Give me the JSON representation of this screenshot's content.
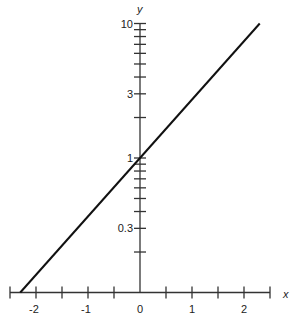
{
  "chart_data": {
    "type": "line",
    "title": "",
    "xlabel": "x",
    "ylabel": "y",
    "yscale": "log",
    "xlim": [
      -2.5,
      2.5
    ],
    "ylim": [
      0.1,
      10
    ],
    "x_ticks": [
      -2.5,
      -2,
      -1.5,
      -1,
      -0.5,
      0,
      0.5,
      1,
      1.5,
      2,
      2.5
    ],
    "x_tick_labels": [
      {
        "value": -2,
        "label": "-2"
      },
      {
        "value": -1,
        "label": "-1"
      },
      {
        "value": 0,
        "label": "0"
      },
      {
        "value": 1,
        "label": "1"
      },
      {
        "value": 2,
        "label": "2"
      }
    ],
    "y_ticks": [
      0.2,
      0.3,
      0.4,
      0.5,
      0.6,
      0.7,
      0.8,
      0.9,
      1,
      2,
      3,
      4,
      5,
      6,
      7,
      8,
      9,
      10
    ],
    "y_tick_labels": [
      {
        "value": 0.3,
        "label": "0.3"
      },
      {
        "value": 1,
        "label": "1"
      },
      {
        "value": 3,
        "label": "3"
      },
      {
        "value": 10,
        "label": "10"
      }
    ],
    "grid": false,
    "legend": null,
    "series": [
      {
        "name": "y = e^x",
        "x": [
          -2.3026,
          2.3026
        ],
        "y": [
          0.1,
          10
        ],
        "color": "#111111"
      }
    ]
  },
  "colors": {
    "axis": "#333333",
    "line": "#111111",
    "text": "#222222"
  }
}
